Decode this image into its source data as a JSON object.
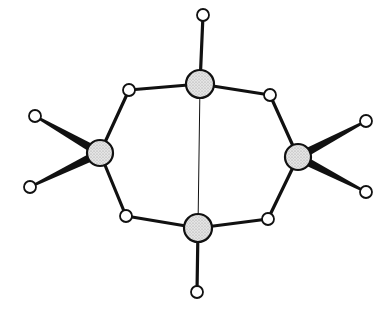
{
  "diagram": {
    "type": "molecular-structure",
    "colors": {
      "background": "#ffffff",
      "stroke": "#111111",
      "large_atom_fill": "#d9d9d9",
      "small_atom_fill": "#ffffff"
    },
    "large_atoms": [
      {
        "id": "A_top",
        "x": 200,
        "y": 84,
        "r": 14
      },
      {
        "id": "A_left",
        "x": 100,
        "y": 153,
        "r": 13
      },
      {
        "id": "A_right",
        "x": 298,
        "y": 157,
        "r": 13
      },
      {
        "id": "A_bottom",
        "x": 198,
        "y": 228,
        "r": 14
      }
    ],
    "small_atoms": [
      {
        "id": "t_top",
        "x": 203,
        "y": 15,
        "r": 6
      },
      {
        "id": "b_tl",
        "x": 129,
        "y": 90,
        "r": 6
      },
      {
        "id": "b_tr",
        "x": 270,
        "y": 95,
        "r": 6
      },
      {
        "id": "b_bl",
        "x": 126,
        "y": 216,
        "r": 6
      },
      {
        "id": "b_br",
        "x": 268,
        "y": 219,
        "r": 6
      },
      {
        "id": "t_bottom",
        "x": 197,
        "y": 292,
        "r": 6
      },
      {
        "id": "t_l1",
        "x": 35,
        "y": 116,
        "r": 6
      },
      {
        "id": "t_l2",
        "x": 30,
        "y": 187,
        "r": 6
      },
      {
        "id": "t_r1",
        "x": 366,
        "y": 121,
        "r": 6
      },
      {
        "id": "t_r2",
        "x": 366,
        "y": 192,
        "r": 6
      }
    ],
    "bonds": [
      {
        "from": "A_top",
        "to": "t_top",
        "style": "solid"
      },
      {
        "from": "A_top",
        "to": "b_tl",
        "style": "solid"
      },
      {
        "from": "A_top",
        "to": "b_tr",
        "style": "solid"
      },
      {
        "from": "b_tl",
        "to": "A_left",
        "style": "solid"
      },
      {
        "from": "b_tr",
        "to": "A_right",
        "style": "solid"
      },
      {
        "from": "A_left",
        "to": "b_bl",
        "style": "solid"
      },
      {
        "from": "A_right",
        "to": "b_br",
        "style": "solid"
      },
      {
        "from": "b_bl",
        "to": "A_bottom",
        "style": "solid"
      },
      {
        "from": "b_br",
        "to": "A_bottom",
        "style": "solid"
      },
      {
        "from": "A_bottom",
        "to": "t_bottom",
        "style": "solid"
      },
      {
        "from": "A_top",
        "to": "A_bottom",
        "style": "thin"
      },
      {
        "from": "A_left",
        "to": "t_l1",
        "style": "wedge"
      },
      {
        "from": "A_left",
        "to": "t_l2",
        "style": "wedge"
      },
      {
        "from": "A_right",
        "to": "t_r1",
        "style": "wedge"
      },
      {
        "from": "A_right",
        "to": "t_r2",
        "style": "wedge"
      }
    ]
  }
}
